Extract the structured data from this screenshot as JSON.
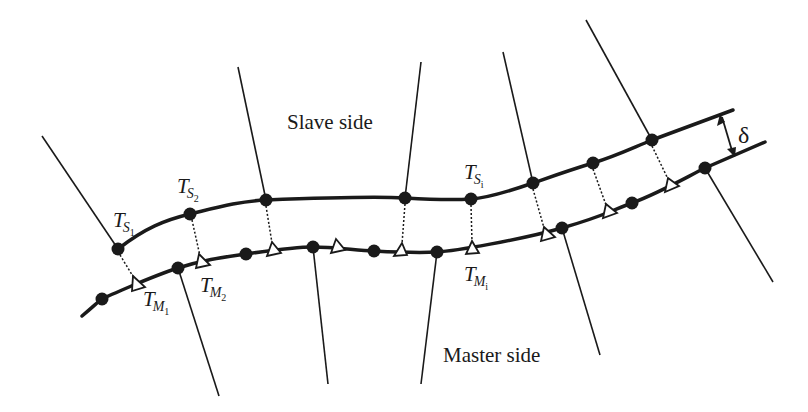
{
  "figure": {
    "labels": {
      "slave_side": "Slave side",
      "master_side": "Master side",
      "delta": "δ"
    },
    "node_labels": {
      "ts1": {
        "base": "T",
        "sub": "S",
        "subsub": "1"
      },
      "ts2": {
        "base": "T",
        "sub": "S",
        "subsub": "2"
      },
      "tsi": {
        "base": "T",
        "sub": "S",
        "subsub": "i"
      },
      "tm1": {
        "base": "T",
        "sub": "M",
        "subsub": "1"
      },
      "tm2": {
        "base": "T",
        "sub": "M",
        "subsub": "2"
      },
      "tmi": {
        "base": "T",
        "sub": "M",
        "subsub": "i"
      }
    },
    "colors": {
      "ink": "#1a1a1a",
      "background": "#ffffff",
      "triangle_fill": "#ffffff"
    },
    "legend_semantics": {
      "filled_circle": "node",
      "open_triangle": "projection point on master surface",
      "dotted_line": "normal projection",
      "double_arrow": "gap distance"
    }
  }
}
